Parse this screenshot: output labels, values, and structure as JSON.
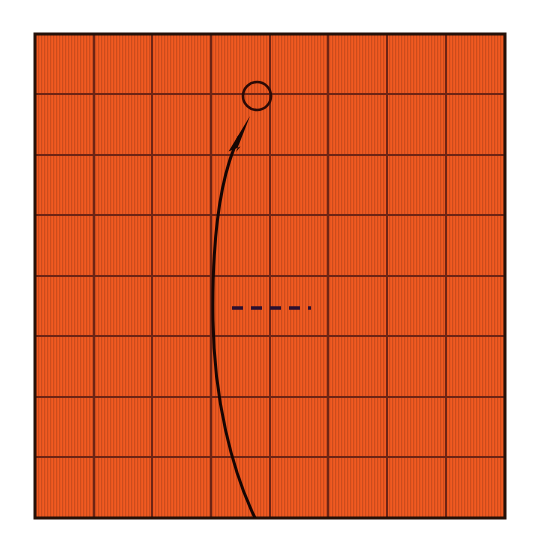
{
  "figure": {
    "title": "",
    "background_color": "#ffffff",
    "canvas": {
      "width": 539,
      "height": 554
    }
  },
  "grid_panel": {
    "name": "orange-grid-panel",
    "fill_color": "#F05A22",
    "texture_color": "#E2501C",
    "border_color": "#241008",
    "border_width": 3,
    "gridline_color": "#6E2414",
    "gridline_width": 1.6,
    "bounds": {
      "x": 35,
      "y": 34,
      "width": 470,
      "height": 484
    },
    "columns": 8,
    "rows": 8,
    "vertical_gridlines_x": [
      94,
      152,
      211,
      270,
      328,
      387,
      446
    ],
    "horizontal_gridlines_y": [
      94,
      155,
      215,
      276,
      336,
      397,
      457
    ]
  },
  "annotations": {
    "circle_marker": {
      "name": "target-circle",
      "center_x": 257,
      "center_y": 96,
      "radius": 14,
      "stroke_color": "#2B0A06",
      "stroke_width": 2.6,
      "fill": "none"
    },
    "curved_arrow": {
      "name": "curved-trajectory-arrow",
      "stroke_color": "#160604",
      "stroke_width": 3.0,
      "path": "M 255 518 C 232 470 214 400 213 320 C 212 250 218 180 239 137",
      "start_point": {
        "x": 255,
        "y": 518
      },
      "end_point": {
        "x": 239,
        "y": 137
      },
      "arrowhead": {
        "name": "arrowhead",
        "tip": {
          "x": 250,
          "y": 116
        },
        "points": "250,116 229,151 243,147 238,151",
        "fill_color": "#160604"
      }
    },
    "dashed_line": {
      "name": "horizontal-dashed-line",
      "y": 308,
      "x_start": 232,
      "x_end": 311,
      "stroke_color": "#2A1030",
      "stroke_width": 3.4,
      "dash_pattern": "11 8",
      "dash_count": 5
    }
  },
  "chart_data": {
    "type": "scatter",
    "title": "",
    "xlabel": "",
    "ylabel": "",
    "grid": true,
    "legend": null,
    "x_ticks": [
      0,
      1,
      2,
      3,
      4,
      5,
      6,
      7,
      8
    ],
    "y_ticks": [
      0,
      1,
      2,
      3,
      4,
      5,
      6,
      7,
      8
    ],
    "xlim": [
      0,
      8
    ],
    "ylim": [
      0,
      8
    ],
    "series": [
      {
        "name": "target-circle",
        "marker": "open-circle",
        "x": [
          3.78
        ],
        "y": [
          6.98
        ]
      },
      {
        "name": "trajectory-curve",
        "marker": "line-with-arrow",
        "x": [
          3.74,
          3.35,
          3.03,
          2.99,
          3.06,
          3.47
        ],
        "y": [
          0.0,
          0.8,
          2.0,
          3.2,
          4.4,
          6.3
        ]
      },
      {
        "name": "dashed-reference-line",
        "marker": "dashed-segment",
        "x": [
          3.35,
          4.56
        ],
        "y": [
          3.47,
          3.47
        ]
      }
    ]
  }
}
